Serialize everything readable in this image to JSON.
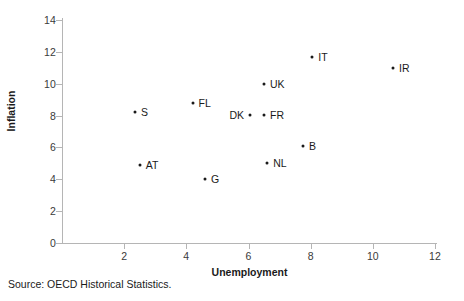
{
  "chart_data": {
    "type": "scatter",
    "title": "",
    "xlabel": "Unemployment",
    "ylabel": "Inflation",
    "xlim": [
      0,
      12
    ],
    "ylim": [
      0,
      14
    ],
    "xticks": [
      2,
      4,
      6,
      8,
      10,
      12
    ],
    "yticks": [
      0,
      2,
      4,
      6,
      8,
      10,
      12,
      14
    ],
    "grid": false,
    "legend": "none",
    "marker_color": "#1a1a1a",
    "axis_color": "#b5b5b5",
    "points": [
      {
        "label": "S",
        "x": 2.35,
        "y": 8.2,
        "label_side": "right"
      },
      {
        "label": "AT",
        "x": 2.5,
        "y": 4.9,
        "label_side": "right"
      },
      {
        "label": "FL",
        "x": 4.2,
        "y": 8.8,
        "label_side": "right"
      },
      {
        "label": "G",
        "x": 4.6,
        "y": 4.0,
        "label_side": "right"
      },
      {
        "label": "DK",
        "x": 6.05,
        "y": 8.05,
        "label_side": "left"
      },
      {
        "label": "FR",
        "x": 6.5,
        "y": 8.05,
        "label_side": "right"
      },
      {
        "label": "UK",
        "x": 6.5,
        "y": 10.0,
        "label_side": "right"
      },
      {
        "label": "NL",
        "x": 6.6,
        "y": 5.0,
        "label_side": "right"
      },
      {
        "label": "B",
        "x": 7.75,
        "y": 6.1,
        "label_side": "right"
      },
      {
        "label": "IT",
        "x": 8.05,
        "y": 11.7,
        "label_side": "right"
      },
      {
        "label": "IR",
        "x": 10.65,
        "y": 11.0,
        "label_side": "right"
      }
    ]
  },
  "source_note": "Source: OECD Historical Statistics."
}
